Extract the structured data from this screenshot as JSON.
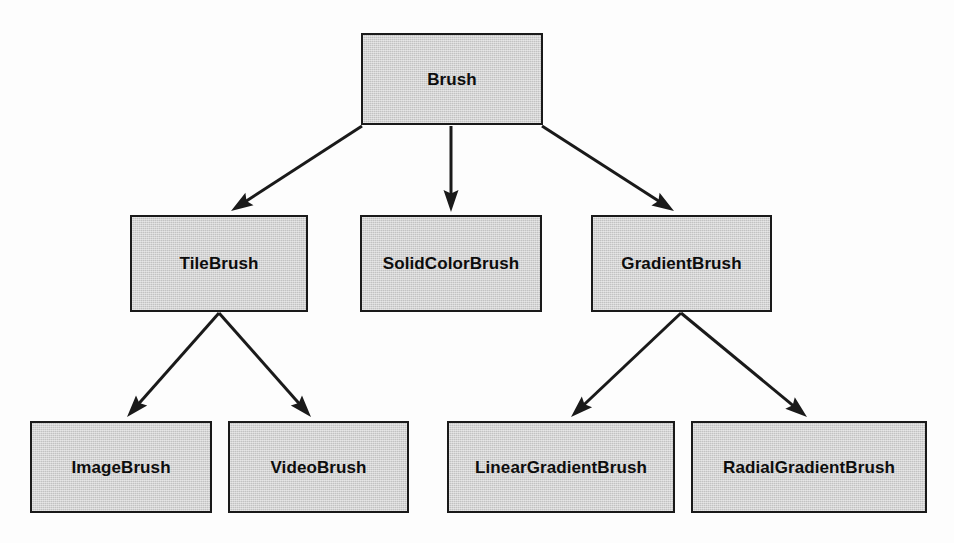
{
  "diagram": {
    "type": "class-inheritance-tree",
    "colors": {
      "node_fill": "#c2c2c2",
      "node_border": "#1a1a1a",
      "edge": "#1a1a1a",
      "text": "#0d0d0d",
      "background": "#fdfdfd"
    },
    "nodes": [
      {
        "id": "brush",
        "label": "Brush",
        "x": 361,
        "y": 33,
        "w": 182,
        "h": 92,
        "level": 0
      },
      {
        "id": "tilebrush",
        "label": "TileBrush",
        "x": 130,
        "y": 215,
        "w": 178,
        "h": 97,
        "level": 1
      },
      {
        "id": "solidcolorbrush",
        "label": "SolidColorBrush",
        "x": 360,
        "y": 215,
        "w": 182,
        "h": 97,
        "level": 1
      },
      {
        "id": "gradientbrush",
        "label": "GradientBrush",
        "x": 591,
        "y": 215,
        "w": 181,
        "h": 97,
        "level": 1
      },
      {
        "id": "imagebrush",
        "label": "ImageBrush",
        "x": 30,
        "y": 421,
        "w": 182,
        "h": 92,
        "level": 2
      },
      {
        "id": "videobrush",
        "label": "VideoBrush",
        "x": 228,
        "y": 421,
        "w": 181,
        "h": 92,
        "level": 2
      },
      {
        "id": "lineargradientbrush",
        "label": "LinearGradientBrush",
        "x": 447,
        "y": 421,
        "w": 228,
        "h": 92,
        "level": 2
      },
      {
        "id": "radialgradientbrush",
        "label": "RadialGradientBrush",
        "x": 691,
        "y": 421,
        "w": 236,
        "h": 92,
        "level": 2
      }
    ],
    "edges": [
      {
        "from": "brush",
        "to": "tilebrush",
        "x1": 362,
        "y1": 126,
        "x2": 231,
        "y2": 211
      },
      {
        "from": "brush",
        "to": "solidcolorbrush",
        "x1": 451,
        "y1": 126,
        "x2": 451,
        "y2": 212
      },
      {
        "from": "brush",
        "to": "gradientbrush",
        "x1": 542,
        "y1": 126,
        "x2": 674,
        "y2": 211
      },
      {
        "from": "tilebrush",
        "to": "imagebrush",
        "x1": 219,
        "y1": 313,
        "x2": 127,
        "y2": 417
      },
      {
        "from": "tilebrush",
        "to": "videobrush",
        "x1": 219,
        "y1": 313,
        "x2": 311,
        "y2": 417
      },
      {
        "from": "gradientbrush",
        "to": "lineargradientbrush",
        "x1": 681,
        "y1": 313,
        "x2": 571,
        "y2": 417
      },
      {
        "from": "gradientbrush",
        "to": "radialgradientbrush",
        "x1": 681,
        "y1": 313,
        "x2": 807,
        "y2": 417
      }
    ]
  }
}
